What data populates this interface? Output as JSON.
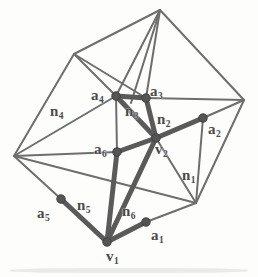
{
  "figure": {
    "kind": "geometry-diagram",
    "canvas": {
      "width": 258,
      "height": 277
    },
    "colors": {
      "background": "#fdfdfc",
      "thin_edge": "#6e6e6e",
      "bold_edge": "#5a5a5a",
      "node_fill": "#555555",
      "label_text": "#4a4a4a"
    },
    "mesh": {
      "outer_nodes": [
        {
          "id": "top",
          "x": 160,
          "y": 10
        },
        {
          "id": "upper_left",
          "x": 74,
          "y": 54
        },
        {
          "id": "right",
          "x": 244,
          "y": 100
        },
        {
          "id": "left",
          "x": 14,
          "y": 156
        },
        {
          "id": "lower_right",
          "x": 196,
          "y": 203
        }
      ],
      "thin_edges": [
        [
          "top",
          "upper_left"
        ],
        [
          "top",
          "right"
        ],
        [
          "upper_left",
          "left"
        ],
        [
          "right",
          "lower_right"
        ],
        [
          "left",
          "lower_right"
        ],
        [
          "top",
          "a4"
        ],
        [
          "top",
          "a3"
        ],
        [
          "top",
          "n3mid"
        ],
        [
          "upper_left",
          "a4"
        ],
        [
          "upper_left",
          "a3"
        ],
        [
          "left",
          "a4"
        ],
        [
          "left",
          "a6"
        ],
        [
          "left",
          "a5"
        ],
        [
          "right",
          "a3"
        ],
        [
          "right",
          "a2"
        ],
        [
          "lower_right",
          "a2"
        ],
        [
          "lower_right",
          "v2"
        ],
        [
          "lower_right",
          "a1"
        ],
        [
          "a4",
          "a6"
        ],
        [
          "a6",
          "v2"
        ],
        [
          "a5",
          "v1"
        ],
        [
          "a1",
          "v1"
        ]
      ],
      "bold_edges": [
        [
          "v1",
          "v2"
        ],
        [
          "v1",
          "a1"
        ],
        [
          "v1",
          "a5"
        ],
        [
          "v1",
          "a6"
        ],
        [
          "v2",
          "a2"
        ],
        [
          "v2",
          "a3"
        ],
        [
          "v2",
          "a6"
        ],
        [
          "a4",
          "a3"
        ],
        [
          "a4",
          "v2"
        ]
      ]
    },
    "vertices": [
      {
        "id": "v1",
        "label": "v",
        "sub": "1",
        "x": 107,
        "y": 242,
        "label_x": 106,
        "label_y": 249,
        "role": "primary-vertex"
      },
      {
        "id": "v2",
        "label": "v",
        "sub": "2",
        "x": 156,
        "y": 138,
        "label_x": 155,
        "label_y": 142,
        "role": "primary-vertex"
      },
      {
        "id": "a1",
        "label": "a",
        "sub": "1",
        "x": 146,
        "y": 222,
        "label_x": 151,
        "label_y": 228,
        "role": "neighbour-vertex"
      },
      {
        "id": "a2",
        "label": "a",
        "sub": "2",
        "x": 203,
        "y": 118,
        "label_x": 208,
        "label_y": 122,
        "role": "neighbour-vertex"
      },
      {
        "id": "a3",
        "label": "a",
        "sub": "3",
        "x": 146,
        "y": 98,
        "label_x": 150,
        "label_y": 84,
        "role": "neighbour-vertex"
      },
      {
        "id": "a4",
        "label": "a",
        "sub": "4",
        "x": 116,
        "y": 96,
        "label_x": 91,
        "label_y": 88,
        "role": "neighbour-vertex"
      },
      {
        "id": "a5",
        "label": "a",
        "sub": "5",
        "x": 61,
        "y": 199,
        "label_x": 37,
        "label_y": 206,
        "role": "neighbour-vertex"
      },
      {
        "id": "a6",
        "label": "a",
        "sub": "6",
        "x": 117,
        "y": 152,
        "label_x": 94,
        "label_y": 142,
        "role": "neighbour-vertex"
      }
    ],
    "normal_labels": [
      {
        "id": "n1",
        "label": "n",
        "sub": "1",
        "label_x": 182,
        "label_y": 168
      },
      {
        "id": "n2",
        "label": "n",
        "sub": "2",
        "label_x": 157,
        "label_y": 112
      },
      {
        "id": "n3",
        "label": "n",
        "sub": "3",
        "label_x": 125,
        "label_y": 104
      },
      {
        "id": "n4",
        "label": "n",
        "sub": "4",
        "label_x": 50,
        "label_y": 104
      },
      {
        "id": "n5",
        "label": "n",
        "sub": "5",
        "label_x": 77,
        "label_y": 198
      },
      {
        "id": "n6",
        "label": "n",
        "sub": "6",
        "label_x": 122,
        "label_y": 204
      }
    ]
  }
}
